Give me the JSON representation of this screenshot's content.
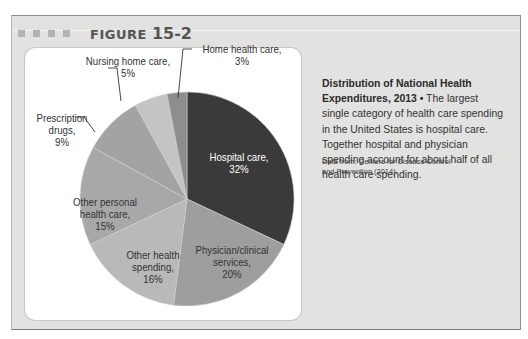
{
  "figure": {
    "label": "FIGURE",
    "number": "15-2"
  },
  "caption": {
    "title": "Distribution of National Health Expenditures, 2013",
    "bullet": "•",
    "text": "The largest single category of health care spending in the United States is hospital care. Together hospital and physician spending account for about half of all health care spending.",
    "source": "Data from: Centers for Disease Control and Prevention (2014)."
  },
  "labels": {
    "hospital": [
      "Hospital care,",
      "32%"
    ],
    "physician": [
      "Physician/clinical",
      "services,",
      "20%"
    ],
    "other_health": [
      "Other health",
      "spending,",
      "16%"
    ],
    "other_personal": [
      "Other personal",
      "health care,",
      "15%"
    ],
    "prescription": [
      "Prescription",
      "drugs,",
      "9%"
    ],
    "nursing": [
      "Nursing home care,",
      "5%"
    ],
    "home_health": [
      "Home health care,",
      "3%"
    ]
  },
  "chart_data": {
    "type": "pie",
    "title": "Distribution of National Health Expenditures, 2013",
    "categories": [
      "Hospital care",
      "Physician/clinical services",
      "Other health spending",
      "Other personal health care",
      "Prescription drugs",
      "Nursing home care",
      "Home health care"
    ],
    "values": [
      32,
      20,
      16,
      15,
      9,
      5,
      3
    ],
    "unit": "%",
    "start_angle": "12 o'clock",
    "direction": "clockwise",
    "colors": [
      "#3a3a3a",
      "#9e9e9e",
      "#b9b9b9",
      "#a8a8a8",
      "#a3a3a3",
      "#c4c4c4",
      "#8e8e8e"
    ],
    "legend": "none (direct labels)",
    "source": "Data from: Centers for Disease Control and Prevention (2014)."
  }
}
